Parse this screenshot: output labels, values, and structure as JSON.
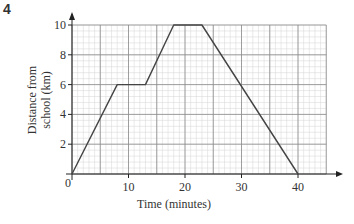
{
  "question_number": "4",
  "chart_data": {
    "type": "line",
    "title": "",
    "xlabel": "Time (minutes)",
    "ylabel": "Distance from school (km)",
    "ylabel_lines": [
      "Distance from",
      "school (km)"
    ],
    "xlim": [
      0,
      45
    ],
    "ylim": [
      0,
      10
    ],
    "x_ticks": [
      0,
      10,
      20,
      30,
      40
    ],
    "y_ticks": [
      2,
      4,
      6,
      8,
      10
    ],
    "origin_label": "0",
    "grid": {
      "on": true,
      "major_x": 5,
      "major_y": 2,
      "minor_x": 1,
      "minor_y": 0.4
    },
    "series": [
      {
        "name": "Journey",
        "x": [
          0,
          8,
          13,
          18,
          23,
          40
        ],
        "y": [
          0,
          6,
          6,
          10,
          10,
          0
        ],
        "color": "#444444"
      }
    ]
  },
  "colors": {
    "minor_grid": "#d4d4d4",
    "major_grid": "#8a8a8a",
    "axis": "#222222",
    "line": "#444444"
  }
}
